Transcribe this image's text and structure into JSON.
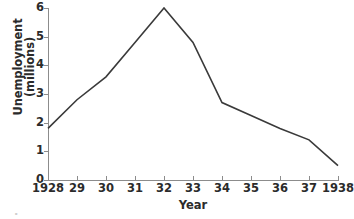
{
  "chart_data": {
    "type": "line",
    "title": "",
    "xlabel": "Year",
    "ylabel": "Unemployment (millions)",
    "ylabel_lines": [
      "Unemployment",
      "(millions)"
    ],
    "x": [
      1928,
      1929,
      1930,
      1931,
      1932,
      1933,
      1934,
      1935,
      1936,
      1937,
      1938
    ],
    "categories": [
      "1928",
      "29",
      "30",
      "31",
      "32",
      "33",
      "34",
      "35",
      "36",
      "37",
      "1938"
    ],
    "values": [
      1.8,
      2.8,
      3.6,
      4.8,
      6.0,
      4.8,
      2.7,
      2.25,
      1.8,
      1.4,
      0.5
    ],
    "series": [
      {
        "name": "Unemployment",
        "values": [
          1.8,
          2.8,
          3.6,
          4.8,
          6.0,
          4.8,
          2.7,
          2.25,
          1.8,
          1.4,
          0.5
        ]
      }
    ],
    "xlim": [
      1928,
      1938
    ],
    "ylim": [
      0,
      6
    ],
    "yticks": [
      0,
      1,
      2,
      3,
      4,
      5,
      6
    ],
    "ytick_labels": [
      "0",
      "1",
      "2",
      "3",
      "4",
      "5",
      "6"
    ],
    "grid": false,
    "legend": false,
    "legend_position": "none",
    "line_color": "#3a3a3a",
    "axis_color": "#8c8c8c",
    "background_color": "#ffffff"
  },
  "axes": {
    "y_label_line1": "Unemployment",
    "y_label_line2": "(millions)",
    "x_label": "Year"
  },
  "bottom_caption": {
    "text": "."
  },
  "icons": {
    "line_series": "line-series-icon"
  }
}
